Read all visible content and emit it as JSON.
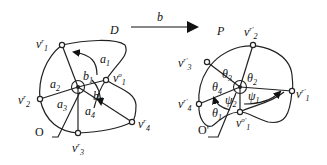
{
  "left_graph": {
    "name": "D",
    "outer_label": "O",
    "faces": [
      "a1",
      "a2",
      "a3",
      "a4"
    ],
    "arc_labels": [
      "b1",
      "b2"
    ],
    "vertices": [
      {
        "id": "v'1",
        "base": "v",
        "sup": "r",
        "sub": "1"
      },
      {
        "id": "v'2",
        "base": "v",
        "sup": "r",
        "sub": "2"
      },
      {
        "id": "v'3",
        "base": "v",
        "sup": "r",
        "sub": "3"
      },
      {
        "id": "v'4",
        "base": "v",
        "sup": "r",
        "sub": "4"
      },
      {
        "id": "v°1",
        "base": "v",
        "sup": "o",
        "sub": "1"
      }
    ],
    "labels": {
      "a1": {
        "base": "a",
        "sub": "1"
      },
      "a2": {
        "base": "a",
        "sub": "2"
      },
      "a3": {
        "base": "a",
        "sub": "3"
      },
      "a4": {
        "base": "a",
        "sub": "4"
      },
      "b1": {
        "base": "b",
        "sub": "1"
      },
      "b2": {
        "base": "b",
        "sub": "2"
      }
    }
  },
  "mapping": {
    "label": "b"
  },
  "right_graph": {
    "name": "P",
    "outer_label": "O'",
    "vertices": [
      {
        "id": "v''1",
        "base": "v",
        "sup": "r'",
        "sub": "1"
      },
      {
        "id": "v''2",
        "base": "v",
        "sup": "r'",
        "sub": "2"
      },
      {
        "id": "v''3",
        "base": "v",
        "sup": "r'",
        "sub": "3"
      },
      {
        "id": "v''4",
        "base": "v",
        "sup": "r'",
        "sub": "4"
      },
      {
        "id": "v°'1",
        "base": "v",
        "sup": "o'",
        "sub": "1"
      }
    ],
    "labels": {
      "theta1": {
        "base": "θ",
        "sub": "1"
      },
      "theta2": {
        "base": "θ",
        "sub": "2"
      },
      "theta3": {
        "base": "θ",
        "sub": "3"
      },
      "theta4": {
        "base": "θ",
        "sub": "4"
      },
      "psi1": {
        "base": "ψ",
        "sub": "1"
      },
      "psi2": {
        "base": "ψ",
        "sub": "2"
      }
    }
  }
}
